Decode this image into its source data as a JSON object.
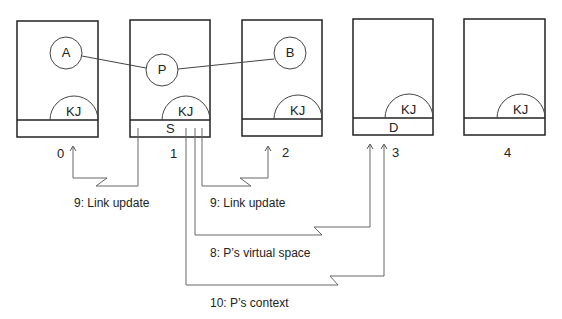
{
  "diagram": {
    "nodes": [
      {
        "id": "0",
        "label": "0",
        "kernel": "KJ",
        "slot": "",
        "process": "A"
      },
      {
        "id": "1",
        "label": "1",
        "kernel": "KJ",
        "slot": "S",
        "process": "P"
      },
      {
        "id": "2",
        "label": "2",
        "kernel": "KJ",
        "slot": "",
        "process": "B"
      },
      {
        "id": "3",
        "label": "3",
        "kernel": "KJ",
        "slot": "D",
        "process": ""
      },
      {
        "id": "4",
        "label": "4",
        "kernel": "KJ",
        "slot": "",
        "process": ""
      }
    ],
    "links": [
      {
        "from": "A",
        "to": "P"
      },
      {
        "from": "P",
        "to": "B"
      }
    ],
    "messages": [
      {
        "label": "9: Link update",
        "from": "1",
        "to": "0"
      },
      {
        "label": "9: Link update",
        "from": "1",
        "to": "2"
      },
      {
        "label": "8: P’s virtual space",
        "from": "1",
        "to": "3"
      },
      {
        "label": "10: P’s context",
        "from": "1",
        "to": "3"
      }
    ]
  }
}
